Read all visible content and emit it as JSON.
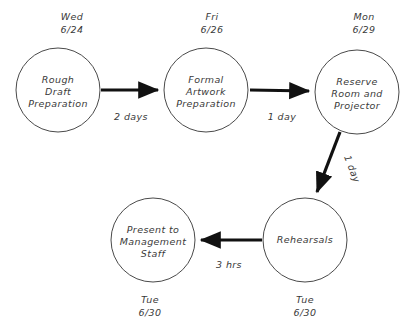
{
  "diagram": {
    "type": "activity-network",
    "stroke_color": "#111111",
    "node_stroke_color": "#4a4a4a",
    "background_color": "#ffffff",
    "nodes": [
      {
        "id": "rough-draft",
        "label_lines": [
          "Rough",
          "Draft",
          "Preparation"
        ],
        "line1": "Rough",
        "line2": "Draft",
        "line3": "Preparation",
        "date_day": "Wed",
        "date_value": "6/24",
        "date_position": "above",
        "cx": 58,
        "cy": 90,
        "r": 42
      },
      {
        "id": "formal-artwork",
        "label_lines": [
          "Formal",
          "Artwork",
          "Preparation"
        ],
        "line1": "Formal",
        "line2": "Artwork",
        "line3": "Preparation",
        "date_day": "Fri",
        "date_value": "6/26",
        "date_position": "above",
        "cx": 206,
        "cy": 90,
        "r": 42
      },
      {
        "id": "reserve-room",
        "label_lines": [
          "Reserve",
          "Room and",
          "Projector"
        ],
        "line1": "Reserve",
        "line2": "Room and",
        "line3": "Projector",
        "date_day": "Mon",
        "date_value": "6/29",
        "date_position": "above",
        "cx": 357,
        "cy": 92,
        "r": 42
      },
      {
        "id": "rehearsals",
        "label_lines": [
          "Rehearsals"
        ],
        "line1": "Rehearsals",
        "line2": "",
        "line3": "",
        "date_day": "Tue",
        "date_value": "6/30",
        "date_position": "below",
        "cx": 305,
        "cy": 240,
        "r": 42
      },
      {
        "id": "present-management",
        "label_lines": [
          "Present to",
          "Management",
          "Staff"
        ],
        "line1": "Present to",
        "line2": "Management",
        "line3": "Staff",
        "date_day": "Tue",
        "date_value": "6/30",
        "date_position": "below",
        "cx": 153,
        "cy": 240,
        "r": 42
      }
    ],
    "edges": [
      {
        "id": "edge-draft-to-artwork",
        "from": "rough-draft",
        "to": "formal-artwork",
        "label": "2 days",
        "label_x": 131,
        "label_y": 117,
        "rotation": 0
      },
      {
        "id": "edge-artwork-to-reserve",
        "from": "formal-artwork",
        "to": "reserve-room",
        "label": "1 day",
        "label_x": 282,
        "label_y": 117,
        "rotation": 0
      },
      {
        "id": "edge-reserve-to-rehearsals",
        "from": "reserve-room",
        "to": "rehearsals",
        "label": "1 day",
        "label_x": 349,
        "label_y": 170,
        "rotation": 69
      },
      {
        "id": "edge-rehearsals-to-present",
        "from": "rehearsals",
        "to": "present-management",
        "label": "3 hrs",
        "label_x": 229,
        "label_y": 265,
        "rotation": 0
      }
    ]
  }
}
